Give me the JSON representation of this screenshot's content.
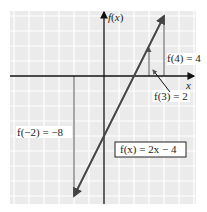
{
  "chart_data": {
    "type": "line",
    "title": "",
    "xlabel": "x",
    "ylabel": "f(x)",
    "xlim": [
      -6.27,
      6.13
    ],
    "ylim": [
      -8.53,
      4.33
    ],
    "grid": true,
    "grid_step": 1,
    "series": [
      {
        "name": "f(x) = 2x − 4",
        "x": [
          -2,
          4
        ],
        "y": [
          -8,
          4
        ],
        "arrows": "both"
      }
    ],
    "highlighted_points": [
      {
        "x": 4,
        "y": 4,
        "label": "f(4) = 4"
      },
      {
        "x": 3,
        "y": 2,
        "label": "f(3) = 2"
      },
      {
        "x": -2,
        "y": -8,
        "label": "f(−2) = −8"
      }
    ],
    "equation_box": "f(x) = 2x − 4"
  },
  "colors": {
    "grid_bg": "#ebebeb",
    "grid_line": "#ffffff",
    "axis": "#111111",
    "graph_line": "#444444",
    "drop_line": "#555555"
  }
}
